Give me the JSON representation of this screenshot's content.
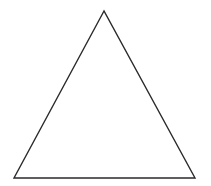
{
  "diagram": {
    "shape": "triangle",
    "vertices": {
      "apex": [
        104,
        11
      ],
      "bottom_left": [
        14,
        178
      ],
      "bottom_right": [
        195,
        178
      ]
    },
    "stroke_color": "#2a2a2a",
    "stroke_width": 1.4,
    "fill_color": "#ffffff",
    "background_color": "#ffffff"
  }
}
